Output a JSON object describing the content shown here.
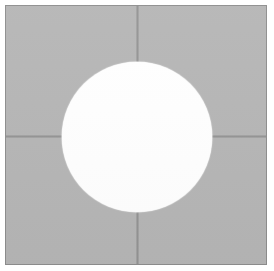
{
  "figure": {
    "canvas": {
      "width_px": 274,
      "height_px": 271,
      "background_color": "#ffffff"
    },
    "plate": {
      "label": "gray-plate",
      "fill_color": "#b5b5b5",
      "outline_color": "#8d8d8d",
      "left_px": 5,
      "top_px": 5,
      "width_px": 262,
      "height_px": 260
    },
    "seams": [
      {
        "label": "vertical-seam",
        "orientation": "vertical",
        "color": "#9a9a9a",
        "position_px": 137,
        "start_px": 5,
        "end_px": 265
      },
      {
        "label": "horizontal-seam",
        "orientation": "horizontal",
        "color": "#9a9a9a",
        "position_px": 136,
        "start_px": 5,
        "end_px": 267
      }
    ],
    "hole": {
      "label": "circular-hole",
      "fill_color": "#ffffff",
      "center_x_px": 137,
      "center_y_px": 137,
      "radius_px": 75,
      "diameter_px": 150
    },
    "margins": {
      "top_px": 5,
      "left_px": 5,
      "right_px": 7,
      "bottom_px": 6,
      "color": "#ffffff"
    }
  }
}
